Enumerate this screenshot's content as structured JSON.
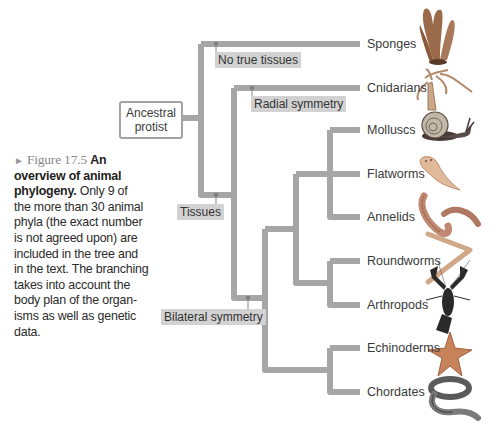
{
  "figure": {
    "label": "Figure 17.5",
    "marker": "►",
    "title": "An overview of animal phylogeny.",
    "body": "Only 9 of the more than 30 animal phyla (the exact number is not agreed upon) are included in the tree and in the text. The branching takes into account the body plan of the organisms as well as genetic data.",
    "lines": [
      "the more than 30 animal",
      "phyla (the exact number",
      "is not agreed upon) are",
      "included in the tree and",
      "in the text. The branching",
      "takes into account the",
      "body plan of the organ-",
      "isms as well as genetic",
      "data."
    ],
    "title_line1": "An",
    "title_line2": "overview of animal",
    "title_line3": "phylogeny.",
    "line3_rest": " Only 9 of"
  },
  "tree": {
    "root": {
      "line1": "Ancestral",
      "line2": "protist"
    },
    "traits": {
      "no_true_tissues": "No true tissues",
      "radial_symmetry": "Radial symmetry",
      "tissues": "Tissues",
      "bilateral_symmetry": "Bilateral symmetry"
    },
    "taxa": [
      {
        "name": "Sponges",
        "icon": "sponge-icon"
      },
      {
        "name": "Cnidarians",
        "icon": "cnidarian-icon"
      },
      {
        "name": "Molluscs",
        "icon": "snail-icon"
      },
      {
        "name": "Flatworms",
        "icon": "flatworm-icon"
      },
      {
        "name": "Annelids",
        "icon": "earthworm-icon"
      },
      {
        "name": "Roundworms",
        "icon": "roundworm-icon"
      },
      {
        "name": "Arthropods",
        "icon": "lobster-icon"
      },
      {
        "name": "Echinoderms",
        "icon": "starfish-icon"
      },
      {
        "name": "Chordates",
        "icon": "snake-icon"
      }
    ],
    "colors": {
      "branch": "#a6a6a6",
      "trait_bg": "#d2d2d2",
      "node_dot": "#7d7d7d"
    }
  }
}
